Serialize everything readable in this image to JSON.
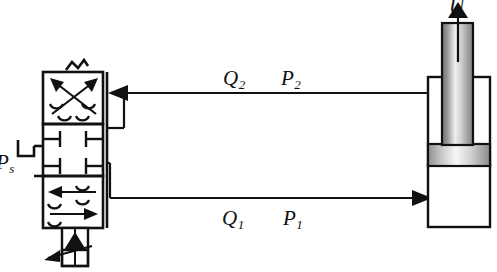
{
  "diagram": {
    "labels": {
      "flow_2": "Q",
      "flow_2_sub": "2",
      "pressure_2": "P",
      "pressure_2_sub": "2",
      "flow_1": "Q",
      "flow_1_sub": "1",
      "pressure_1": "P",
      "pressure_1_sub": "1",
      "supply_pressure": "P",
      "supply_pressure_sub": "s",
      "velocity": "U"
    },
    "colors": {
      "line": "#111111",
      "fill": "#ffffff",
      "rod_light": "#f2f2f2",
      "rod_mid": "#b8b8b8",
      "rod_dark": "#6f6f6f",
      "piston_light": "#fafafa",
      "piston_dark": "#8a8a8a"
    },
    "components": {
      "valve": {
        "name": "proportional-directional-control-valve",
        "positions": 3,
        "top_position": "crossed-arrows",
        "middle_position": "closed-center",
        "bottom_position": "parallel-arrows",
        "spring_return": "zigzag-spring",
        "actuator": "proportional-solenoid"
      },
      "cylinder": {
        "name": "double-acting-cylinder",
        "rod_direction": "up",
        "motion_label": "U"
      },
      "line_upper": {
        "name": "return-line-q2",
        "arrow_direction": "left"
      },
      "line_lower": {
        "name": "supply-line-q1",
        "arrow_direction": "right"
      }
    }
  }
}
